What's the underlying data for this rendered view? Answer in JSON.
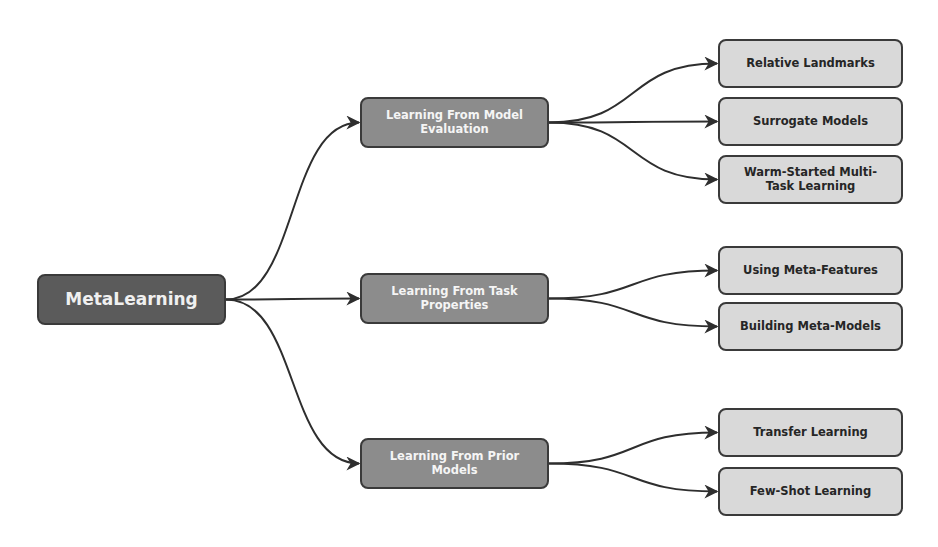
{
  "diagram": {
    "root": {
      "id": "root",
      "label": "MetaLearning"
    },
    "branches": [
      {
        "id": "model-evaluation",
        "label": "Learning From Model Evaluation",
        "children": [
          {
            "id": "relative-landmarks",
            "label": "Relative Landmarks"
          },
          {
            "id": "surrogate-models",
            "label": "Surrogate Models"
          },
          {
            "id": "warm-started",
            "label": "Warm-Started Multi-Task Learning"
          }
        ]
      },
      {
        "id": "task-properties",
        "label": "Learning From Task Properties",
        "children": [
          {
            "id": "meta-features",
            "label": "Using Meta-Features"
          },
          {
            "id": "meta-models",
            "label": "Building Meta-Models"
          }
        ]
      },
      {
        "id": "prior-models",
        "label": "Learning From Prior Models",
        "children": [
          {
            "id": "transfer-learning",
            "label": "Transfer Learning"
          },
          {
            "id": "few-shot-learning",
            "label": "Few-Shot Learning"
          }
        ]
      }
    ]
  },
  "colors": {
    "root_fill": "#5b5b5b",
    "branch_fill": "#8c8c8c",
    "leaf_fill": "#d9d9d9",
    "edge": "#2e2e2e"
  }
}
